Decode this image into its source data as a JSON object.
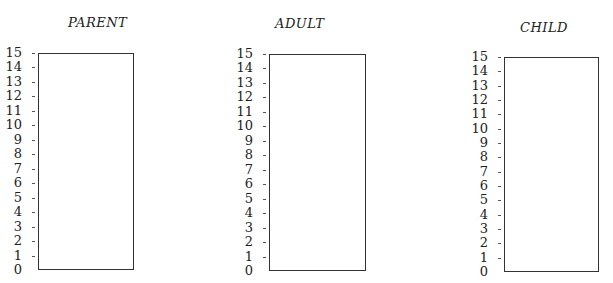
{
  "chart_data": [
    {
      "type": "bar",
      "title": "PARENT",
      "categories": [],
      "values": [],
      "xlabel": "",
      "ylabel": "",
      "ylim": [
        0,
        15
      ],
      "yticks": [
        "0",
        "1",
        "2",
        "3",
        "4",
        "5",
        "6",
        "7",
        "8",
        "9",
        "10",
        "11",
        "12",
        "13",
        "14",
        "15"
      ],
      "grid": false,
      "legend": null
    },
    {
      "type": "bar",
      "title": "ADULT",
      "categories": [],
      "values": [],
      "xlabel": "",
      "ylabel": "",
      "ylim": [
        0,
        15
      ],
      "yticks": [
        "0",
        "1",
        "2",
        "3",
        "4",
        "5",
        "6",
        "7",
        "8",
        "9",
        "10",
        "11",
        "12",
        "13",
        "14",
        "15"
      ],
      "grid": false,
      "legend": null
    },
    {
      "type": "bar",
      "title": "CHILD",
      "categories": [],
      "values": [],
      "xlabel": "",
      "ylabel": "",
      "ylim": [
        0,
        15
      ],
      "yticks": [
        "0",
        "1",
        "2",
        "3",
        "4",
        "5",
        "6",
        "7",
        "8",
        "9",
        "10",
        "11",
        "12",
        "13",
        "14",
        "15"
      ],
      "grid": false,
      "legend": null
    }
  ],
  "panels": [
    {
      "title": "PARENT",
      "ticks": [
        "0",
        "1",
        "2",
        "3",
        "4",
        "5",
        "6",
        "7",
        "8",
        "9",
        "10",
        "11",
        "12",
        "13",
        "14",
        "15"
      ]
    },
    {
      "title": "ADULT",
      "ticks": [
        "0",
        "1",
        "2",
        "3",
        "4",
        "5",
        "6",
        "7",
        "8",
        "9",
        "10",
        "11",
        "12",
        "13",
        "14",
        "15"
      ]
    },
    {
      "title": "CHILD",
      "ticks": [
        "0",
        "1",
        "2",
        "3",
        "4",
        "5",
        "6",
        "7",
        "8",
        "9",
        "10",
        "11",
        "12",
        "13",
        "14",
        "15"
      ]
    }
  ]
}
